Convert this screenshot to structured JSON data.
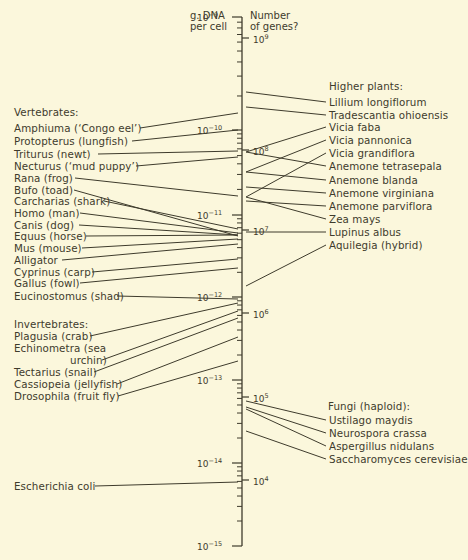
{
  "headers": {
    "left": "g. DNA\nper cell",
    "right": "Number\nof genes?"
  },
  "axis_left_ticks": [
    {
      "base": "10",
      "exp": "−9",
      "y": 17
    },
    {
      "base": "10",
      "exp": "−10",
      "y": 130
    },
    {
      "base": "10",
      "exp": "−11",
      "y": 215
    },
    {
      "base": "10",
      "exp": "−12",
      "y": 297
    },
    {
      "base": "10",
      "exp": "−13",
      "y": 380
    },
    {
      "base": "10",
      "exp": "−14",
      "y": 463
    },
    {
      "base": "10",
      "exp": "−15",
      "y": 546
    }
  ],
  "axis_right_ticks": [
    {
      "base": "10",
      "exp": "9",
      "y": 38
    },
    {
      "base": "10",
      "exp": "8",
      "y": 150
    },
    {
      "base": "10",
      "exp": "7",
      "y": 230
    },
    {
      "base": "10",
      "exp": "6",
      "y": 313
    },
    {
      "base": "10",
      "exp": "5",
      "y": 397
    },
    {
      "base": "10",
      "exp": "4",
      "y": 480
    }
  ],
  "groups": {
    "vertebrates": "Vertebrates:",
    "invertebrates": "Invertebrates:",
    "plants": "Higher plants:",
    "fungi": "Fungi (haploid):"
  },
  "left_labels": [
    {
      "text": "Amphiuma (‘Congo eel’)",
      "y": 128,
      "lx": 138,
      "ay": 113
    },
    {
      "text": "Protopterus (lungfish)",
      "y": 141,
      "lx": 130,
      "ay": 130
    },
    {
      "text": "Triturus (newt)",
      "y": 154,
      "lx": 96,
      "ay": 151
    },
    {
      "text": "Necturus (‘mud puppy’)",
      "y": 166,
      "lx": 134,
      "ay": 157
    },
    {
      "text": "Rana (frog)",
      "y": 178,
      "lx": 73,
      "ay": 196
    },
    {
      "text": "Bufo (toad)",
      "y": 190,
      "lx": 72,
      "ay": 236
    },
    {
      "text": "Carcharias (shark)",
      "y": 201,
      "lx": 102,
      "ay": 229
    },
    {
      "text": "Homo (man)",
      "y": 213,
      "lx": 78,
      "ay": 233
    },
    {
      "text": "Canis (dog)",
      "y": 225,
      "lx": 77,
      "ay": 235
    },
    {
      "text": "Equus (horse)",
      "y": 236,
      "lx": 84,
      "ay": 235
    },
    {
      "text": "Mus (mouse)",
      "y": 248,
      "lx": 80,
      "ay": 239
    },
    {
      "text": "Alligator",
      "y": 260,
      "lx": 60,
      "ay": 244
    },
    {
      "text": "Cyprinus (carp)",
      "y": 272,
      "lx": 90,
      "ay": 259
    },
    {
      "text": "Gallus (fowl)",
      "y": 283,
      "lx": 78,
      "ay": 268
    },
    {
      "text": "Eucinostomus (shad)",
      "y": 296,
      "lx": 115,
      "ay": 299
    },
    {
      "text": "Plagusia (crab)",
      "y": 336,
      "lx": 88,
      "ay": 303
    },
    {
      "text": "Echinometra (sea",
      "y": 348,
      "lx": null,
      "ay": null
    },
    {
      "text": "urchin)",
      "y": 360,
      "lx": 100,
      "ay": 311
    },
    {
      "text": "Tectarius (snail)",
      "y": 372,
      "lx": 92,
      "ay": 318
    },
    {
      "text": "Cassiopeia (jellyfish)",
      "y": 384,
      "lx": 115,
      "ay": 337
    },
    {
      "text": "Drosophila (fruit fly)",
      "y": 396,
      "lx": 116,
      "ay": 361
    },
    {
      "text": "Escherichia coli",
      "y": 486,
      "lx": 93,
      "ay": 482
    }
  ],
  "right_labels": [
    {
      "text": "Lillium longiflorum",
      "y": 102,
      "ay": 92
    },
    {
      "text": "Tradescantia ohioensis",
      "y": 115,
      "ay": 107
    },
    {
      "text": "Vicia faba",
      "y": 127,
      "ay": 152
    },
    {
      "text": "Vicia pannonica",
      "y": 140,
      "ay": 172
    },
    {
      "text": "Vicia grandiflora",
      "y": 153,
      "ay": 197
    },
    {
      "text": "Anemone tetrasepala",
      "y": 166,
      "ay": 152
    },
    {
      "text": "Anemone blanda",
      "y": 180,
      "ay": 172
    },
    {
      "text": "Anemone virginiana",
      "y": 193,
      "ay": 187
    },
    {
      "text": "Anemone parviflora",
      "y": 206,
      "ay": 201
    },
    {
      "text": "Zea mays",
      "y": 219,
      "ay": 197
    },
    {
      "text": "Lupinus albus",
      "y": 232,
      "ay": 232
    },
    {
      "text": "Aquilegia (hybrid)",
      "y": 245,
      "ay": 286
    },
    {
      "text": "Ustilago maydis",
      "y": 420,
      "ay": 401
    },
    {
      "text": "Neurospora crassa",
      "y": 433,
      "ay": 407
    },
    {
      "text": "Aspergillus nidulans",
      "y": 446,
      "ay": 409
    },
    {
      "text": "Saccharomyces cerevisiae",
      "y": 459,
      "ay": 431
    }
  ],
  "colors": {
    "background": "#fbf7dc",
    "ink": "#3e3b2c"
  }
}
